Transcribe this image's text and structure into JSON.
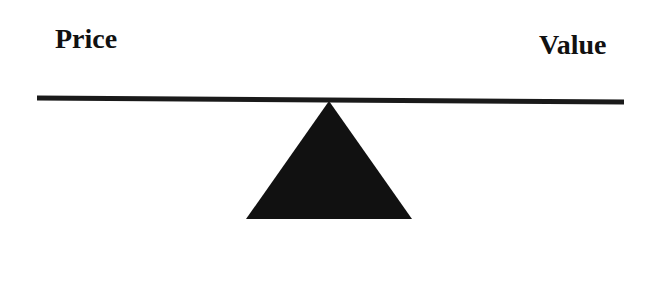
{
  "diagram": {
    "type": "seesaw-balance",
    "left_label": "Price",
    "right_label": "Value",
    "colors": {
      "background": "#ffffff",
      "beam": "#1a1a1a",
      "fulcrum": "#111111",
      "text": "#111111"
    }
  }
}
